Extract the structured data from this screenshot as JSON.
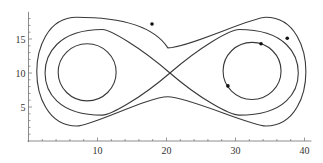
{
  "chart_data": {
    "type": "line",
    "title": "",
    "xlabel": "",
    "ylabel": "",
    "xlim": [
      0,
      41
    ],
    "ylim": [
      0,
      19
    ],
    "grid": false,
    "legend": null,
    "x_ticks": [
      10,
      20,
      30,
      40
    ],
    "x_tick_labels": [
      "10",
      "20",
      "30",
      "40"
    ],
    "y_ticks": [
      5,
      10,
      15
    ],
    "y_tick_labels": [
      "5",
      "10",
      "15"
    ],
    "x_minor_step": 2,
    "y_minor_step": 1,
    "series": [
      {
        "name": "left-inner-orbit",
        "shape": "closed-loop",
        "center": [
          8.5,
          10.1
        ],
        "radius_x": 4.2,
        "radius_y": 4.2
      },
      {
        "name": "right-inner-orbit",
        "shape": "closed-loop",
        "center": [
          32.4,
          10.3
        ],
        "radius_x": 4.2,
        "radius_y": 4.2
      },
      {
        "name": "separatrix-figure-eight",
        "shape": "figure-eight",
        "crossing_point": [
          20.5,
          10.0
        ],
        "x_range": [
          2.4,
          39.1
        ],
        "y_range": [
          3.8,
          16.4
        ]
      },
      {
        "name": "outer-orbit",
        "shape": "peanut-loop",
        "x_range": [
          1.2,
          40.2
        ],
        "y_range": [
          2.2,
          18.2
        ],
        "waist_y": [
          6.5,
          13.7
        ]
      }
    ],
    "markers": [
      {
        "x": 17.9,
        "y": 17.2,
        "on": "outer-orbit"
      },
      {
        "x": 37.5,
        "y": 15.1,
        "on": "outer-orbit"
      },
      {
        "x": 33.7,
        "y": 14.3,
        "on": "separatrix-figure-eight"
      },
      {
        "x": 28.9,
        "y": 8.1,
        "on": "right-inner-orbit"
      }
    ]
  },
  "axes": {
    "x_labels": [
      "10",
      "20",
      "30",
      "40"
    ],
    "y_labels": [
      "5",
      "10",
      "15"
    ]
  }
}
